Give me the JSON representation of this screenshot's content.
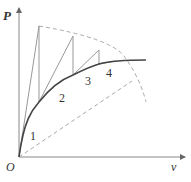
{
  "diagram": {
    "axes": {
      "y_label": "P",
      "x_label": "v",
      "origin_label": "O"
    },
    "steps": [
      {
        "label": "1"
      },
      {
        "label": "2"
      },
      {
        "label": "3"
      },
      {
        "label": "4"
      }
    ],
    "colors": {
      "axis": "#888888",
      "curve": "#444444",
      "steps": "#999999",
      "dashed": "#aaaaaa",
      "text": "#333333"
    }
  }
}
